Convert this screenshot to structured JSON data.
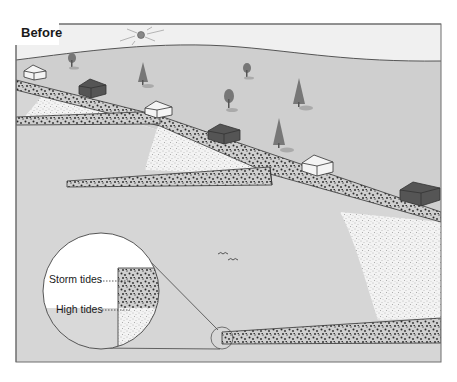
{
  "figure": {
    "title": "Before",
    "callouts": {
      "storm_tides": "Storm tides",
      "high_tides": "High tides"
    },
    "elements": {
      "houses": 8,
      "trees": 6,
      "sun": 1,
      "birds": 2,
      "magnifier": "inset circle showing tide levels on barrier wall"
    },
    "colors": {
      "land": "#cfcfcf",
      "sky": "#f0f0f0",
      "water": "#d8d8d8",
      "sand": "#efefef",
      "gravel_dark": "#3a3a3a",
      "house_light": "#f4f4f4",
      "house_dark": "#555555",
      "tree": "#7a7a7a",
      "frame": "#6f6f6f"
    }
  }
}
